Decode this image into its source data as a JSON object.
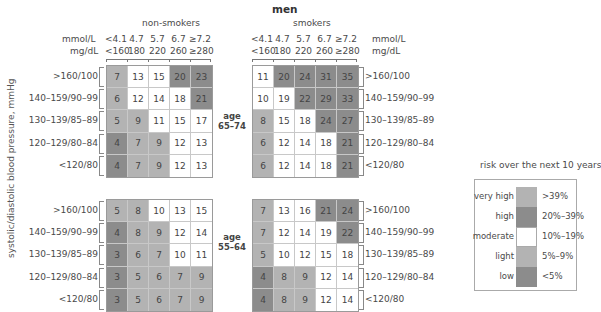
{
  "chart_data": {
    "type": "heatmap",
    "title": "men",
    "subtitle": "risk over the next 10 years",
    "ylabel": "systolic/diastolic blood pressure, mmHg",
    "groups": [
      "non-smokers",
      "smokers"
    ],
    "x_axis": {
      "units": [
        "mmol/L",
        "mg/dL"
      ],
      "ticks_mmol": [
        "<4.1",
        "4.7",
        "5.7",
        "6.7",
        "≥7.2"
      ],
      "ticks_mgdl": [
        "<160",
        "180",
        "220",
        "260",
        "≥280"
      ]
    },
    "rows": [
      ">160/100",
      "140–159/90–99",
      "130–139/85–89",
      "120–129/80–84",
      "<120/80"
    ],
    "panels": [
      {
        "age_label": "age",
        "age_range": "65–74",
        "non_smokers": [
          [
            7,
            13,
            15,
            20,
            23
          ],
          [
            6,
            12,
            14,
            18,
            21
          ],
          [
            5,
            9,
            11,
            15,
            17
          ],
          [
            4,
            7,
            9,
            12,
            13
          ],
          [
            4,
            7,
            9,
            12,
            13
          ]
        ],
        "smokers": [
          [
            11,
            20,
            24,
            31,
            35
          ],
          [
            10,
            19,
            22,
            29,
            33
          ],
          [
            8,
            15,
            18,
            24,
            27
          ],
          [
            6,
            12,
            14,
            18,
            21
          ],
          [
            6,
            12,
            14,
            18,
            21
          ]
        ]
      },
      {
        "age_label": "age",
        "age_range": "55–64",
        "non_smokers": [
          [
            5,
            8,
            10,
            13,
            15
          ],
          [
            4,
            8,
            9,
            12,
            14
          ],
          [
            3,
            6,
            7,
            10,
            11
          ],
          [
            3,
            5,
            6,
            7,
            9
          ],
          [
            3,
            5,
            6,
            7,
            9
          ]
        ],
        "smokers": [
          [
            7,
            13,
            16,
            21,
            24
          ],
          [
            7,
            12,
            14,
            19,
            22
          ],
          [
            5,
            10,
            12,
            15,
            18
          ],
          [
            4,
            8,
            9,
            12,
            14
          ],
          [
            4,
            8,
            9,
            12,
            14
          ]
        ]
      }
    ],
    "legend": [
      {
        "label": "very high",
        "range": ">39%",
        "color": "#b3b3b3"
      },
      {
        "label": "high",
        "range": "20%–39%",
        "color": "#8c8c8c"
      },
      {
        "label": "moderate",
        "range": "10%–19%",
        "color": "#ffffff"
      },
      {
        "label": "light",
        "range": "5%–9%",
        "color": "#b3b3b3"
      },
      {
        "label": "low",
        "range": "<5%",
        "color": "#8c8c8c"
      }
    ]
  }
}
